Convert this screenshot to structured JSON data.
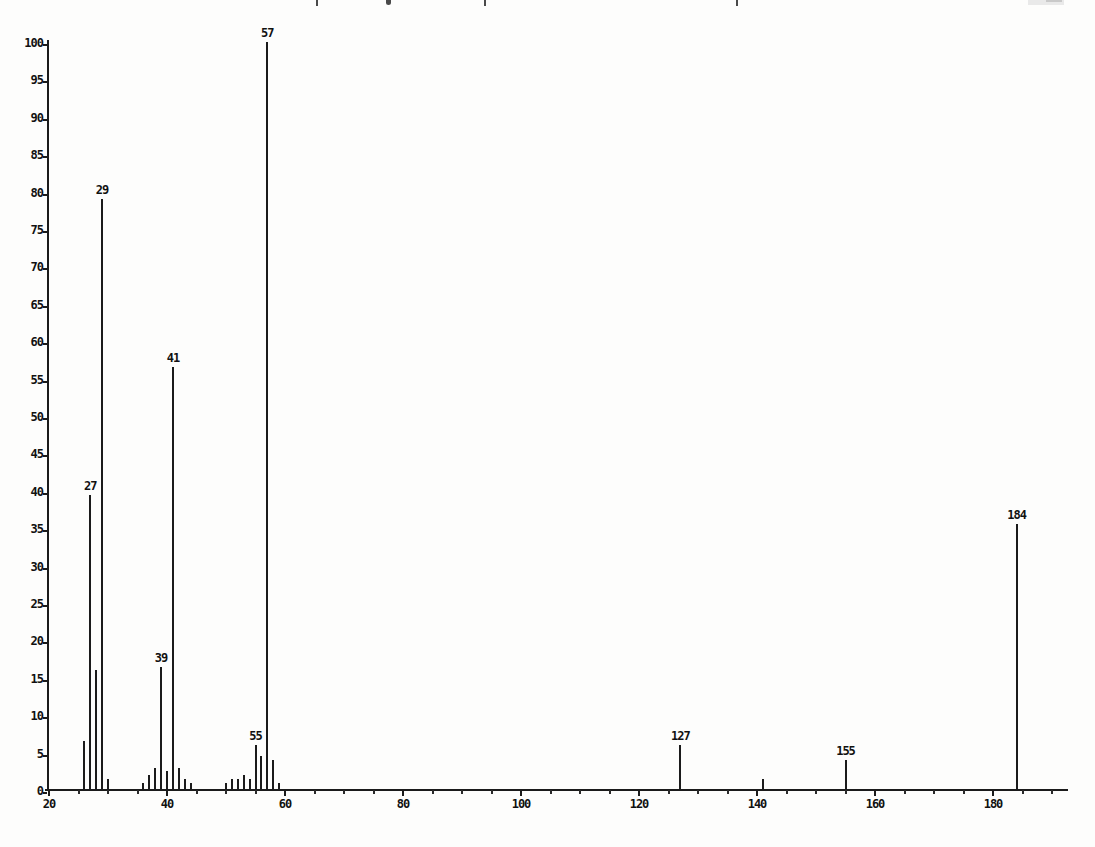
{
  "chart_data": {
    "type": "bar",
    "subtype": "mass-spectrum-stick-plot",
    "title": "",
    "xlabel": "",
    "ylabel": "",
    "xlim": [
      20,
      193
    ],
    "ylim": [
      0,
      100
    ],
    "grid": "off",
    "legend": "none",
    "x_ticks_major": [
      20,
      40,
      60,
      80,
      100,
      120,
      140,
      160,
      180
    ],
    "x_tick_minor_step": 5,
    "y_ticks": [
      0,
      5,
      10,
      15,
      20,
      25,
      30,
      35,
      40,
      45,
      50,
      55,
      60,
      65,
      70,
      75,
      80,
      85,
      90,
      95,
      100
    ],
    "peaks": [
      {
        "mz": 26,
        "intensity": 6.5
      },
      {
        "mz": 27,
        "intensity": 39.5,
        "label": "27"
      },
      {
        "mz": 28,
        "intensity": 16
      },
      {
        "mz": 29,
        "intensity": 79,
        "label": "29"
      },
      {
        "mz": 30,
        "intensity": 1.5
      },
      {
        "mz": 36,
        "intensity": 1
      },
      {
        "mz": 37,
        "intensity": 2
      },
      {
        "mz": 38,
        "intensity": 3
      },
      {
        "mz": 39,
        "intensity": 16.5,
        "label": "39"
      },
      {
        "mz": 40,
        "intensity": 2.5
      },
      {
        "mz": 41,
        "intensity": 56.5,
        "label": "41"
      },
      {
        "mz": 42,
        "intensity": 3
      },
      {
        "mz": 43,
        "intensity": 1.5
      },
      {
        "mz": 44,
        "intensity": 1
      },
      {
        "mz": 50,
        "intensity": 1
      },
      {
        "mz": 51,
        "intensity": 1.5
      },
      {
        "mz": 52,
        "intensity": 1.5
      },
      {
        "mz": 53,
        "intensity": 2
      },
      {
        "mz": 54,
        "intensity": 1.5
      },
      {
        "mz": 55,
        "intensity": 6,
        "label": "55"
      },
      {
        "mz": 56,
        "intensity": 4.5
      },
      {
        "mz": 57,
        "intensity": 100,
        "label": "57"
      },
      {
        "mz": 58,
        "intensity": 4
      },
      {
        "mz": 59,
        "intensity": 1
      },
      {
        "mz": 127,
        "intensity": 6,
        "label": "127"
      },
      {
        "mz": 141,
        "intensity": 1.5
      },
      {
        "mz": 155,
        "intensity": 4,
        "label": "155"
      },
      {
        "mz": 184,
        "intensity": 35.5,
        "label": "184"
      }
    ],
    "ink_color": "#1b1b1b"
  },
  "scan_artifacts": {
    "top_edge": "partially cropped descenders of a page-header text line",
    "top_right": "faint gray smudge (cropped page number)"
  }
}
